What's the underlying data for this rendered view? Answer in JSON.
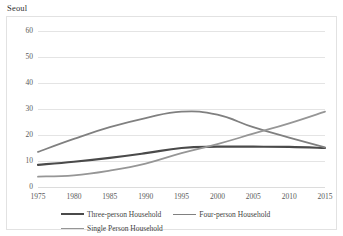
{
  "chart_data": {
    "type": "line",
    "title": "Seoul",
    "xlabel": "",
    "ylabel": "",
    "x": [
      1975,
      1980,
      1985,
      1990,
      1995,
      2000,
      2005,
      2010,
      2015
    ],
    "xtick_labels": [
      "1975",
      "1980",
      "1985",
      "1990",
      "1995",
      "2000",
      "2005",
      "2010",
      "2015"
    ],
    "ytick_labels": [
      "0",
      "10",
      "20",
      "30",
      "40",
      "50",
      "60"
    ],
    "yticks": [
      0,
      10,
      20,
      30,
      40,
      50,
      60
    ],
    "ylim": [
      0,
      60
    ],
    "xlim": [
      1975,
      2015
    ],
    "grid": "horizontal",
    "legend_position": "bottom",
    "series": [
      {
        "name": "Three-person Household",
        "color": "#4a4a4a",
        "width": 2.2,
        "values": [
          8.5,
          9.7,
          11.2,
          13.0,
          15.0,
          15.5,
          15.5,
          15.4,
          15.0
        ]
      },
      {
        "name": "Four-person Household",
        "color": "#808080",
        "width": 1.8,
        "values": [
          13.5,
          18.5,
          23.0,
          26.5,
          29.0,
          27.8,
          23.0,
          19.0,
          15.2
        ]
      },
      {
        "name": "Single Person Household",
        "color": "#969696",
        "width": 1.8,
        "values": [
          4.0,
          4.5,
          6.3,
          9.0,
          13.0,
          16.5,
          20.5,
          24.5,
          29.0
        ]
      }
    ]
  },
  "legend": {
    "rows": [
      [
        "Three-person Household",
        "Four-person Household"
      ],
      [
        "Single Person Household"
      ]
    ]
  }
}
